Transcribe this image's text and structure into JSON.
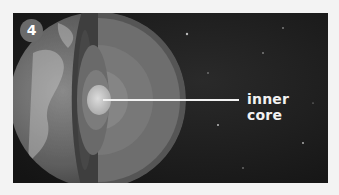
{
  "figure": {
    "step_number": "4",
    "label": "inner core",
    "colors": {
      "background": "#1a1a1a",
      "page": "#f3f3f3",
      "badge": "#6a6a6a",
      "pointer_line": "#f2f2f2"
    }
  }
}
